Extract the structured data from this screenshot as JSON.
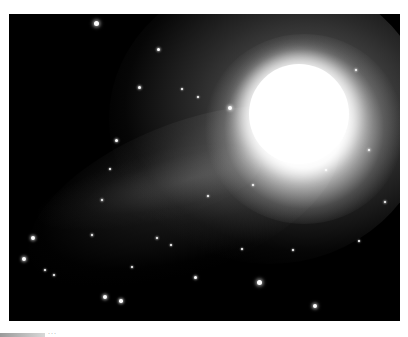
{
  "photo": {
    "subject": "comet with bright coma and curved tail against star field",
    "background_color": "#000000",
    "nucleus_color": "#ffffff",
    "stars": [
      {
        "x": 87,
        "y": 9,
        "r": 2.5
      },
      {
        "x": 149,
        "y": 35,
        "r": 1.5
      },
      {
        "x": 130,
        "y": 73,
        "r": 1.5
      },
      {
        "x": 221,
        "y": 94,
        "r": 2
      },
      {
        "x": 107,
        "y": 126,
        "r": 1.5
      },
      {
        "x": 101,
        "y": 155,
        "r": 1
      },
      {
        "x": 24,
        "y": 224,
        "r": 2
      },
      {
        "x": 15,
        "y": 245,
        "r": 2
      },
      {
        "x": 36,
        "y": 256,
        "r": 1.2
      },
      {
        "x": 45,
        "y": 261,
        "r": 1.2
      },
      {
        "x": 83,
        "y": 221,
        "r": 1.3
      },
      {
        "x": 93,
        "y": 186,
        "r": 1.3
      },
      {
        "x": 148,
        "y": 224,
        "r": 1.3
      },
      {
        "x": 162,
        "y": 231,
        "r": 1
      },
      {
        "x": 123,
        "y": 253,
        "r": 1.2
      },
      {
        "x": 96,
        "y": 283,
        "r": 2
      },
      {
        "x": 112,
        "y": 287,
        "r": 1.8
      },
      {
        "x": 186,
        "y": 263,
        "r": 1.5
      },
      {
        "x": 250,
        "y": 268,
        "r": 2.5
      },
      {
        "x": 306,
        "y": 292,
        "r": 2.2
      },
      {
        "x": 284,
        "y": 236,
        "r": 1
      },
      {
        "x": 233,
        "y": 235,
        "r": 1
      },
      {
        "x": 317,
        "y": 156,
        "r": 1.2
      },
      {
        "x": 360,
        "y": 136,
        "r": 1.4
      },
      {
        "x": 347,
        "y": 56,
        "r": 1.3
      },
      {
        "x": 376,
        "y": 188,
        "r": 1.3
      },
      {
        "x": 350,
        "y": 227,
        "r": 1
      },
      {
        "x": 244,
        "y": 171,
        "r": 1
      },
      {
        "x": 199,
        "y": 182,
        "r": 1
      },
      {
        "x": 173,
        "y": 75,
        "r": 1
      },
      {
        "x": 189,
        "y": 83,
        "r": 1
      }
    ]
  },
  "caption": {
    "text": "···"
  }
}
